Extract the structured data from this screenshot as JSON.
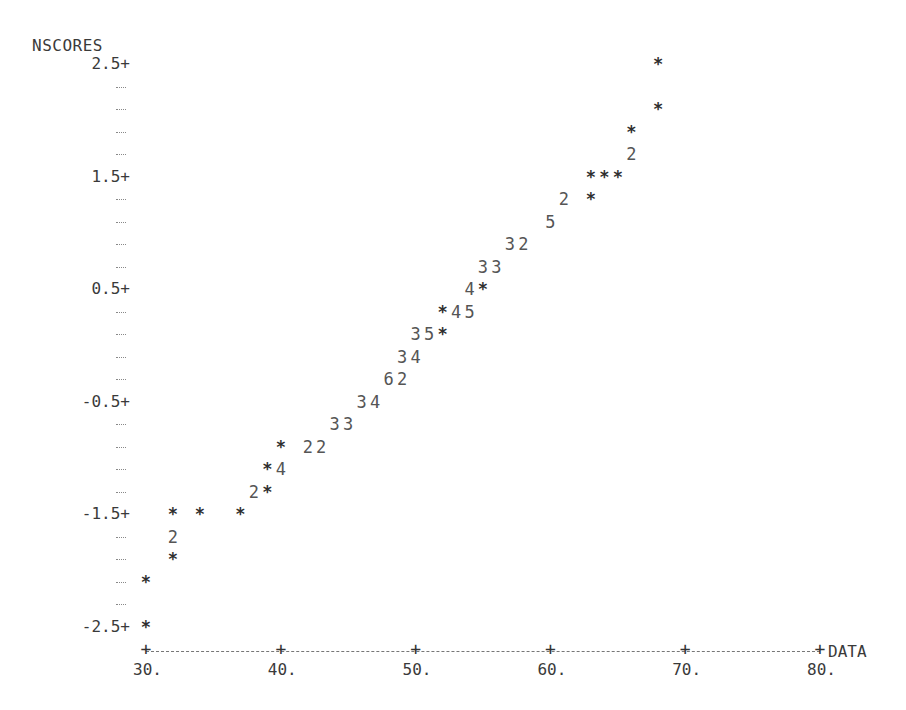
{
  "chart_data": {
    "type": "scatter",
    "title": "",
    "xlabel": "DATA",
    "ylabel": "NSCORES",
    "xlim": [
      30,
      80
    ],
    "ylim": [
      -2.5,
      2.5
    ],
    "x_ticks": [
      "30.",
      "40.",
      "50.",
      "60.",
      "70.",
      "80."
    ],
    "y_ticks": [
      "2.5",
      "1.5",
      "0.5",
      "-0.5",
      "-1.5",
      "-2.5"
    ],
    "grid": false,
    "legend": null,
    "note": "Character line-printer normal probability plot; digits indicate number of overlapping observations at that cell, '*' indicates one.",
    "rows": [
      {
        "y": 2.5,
        "cells": [
          {
            "x": 68,
            "mark": "*"
          }
        ]
      },
      {
        "y": 2.3,
        "cells": []
      },
      {
        "y": 2.1,
        "cells": [
          {
            "x": 68,
            "mark": "*"
          }
        ]
      },
      {
        "y": 1.9,
        "cells": [
          {
            "x": 66,
            "mark": "*"
          }
        ]
      },
      {
        "y": 1.7,
        "cells": [
          {
            "x": 66,
            "mark": "2"
          }
        ]
      },
      {
        "y": 1.5,
        "cells": [
          {
            "x": 63,
            "mark": "*"
          },
          {
            "x": 64,
            "mark": "*"
          },
          {
            "x": 65,
            "mark": "*"
          }
        ]
      },
      {
        "y": 1.3,
        "cells": [
          {
            "x": 61,
            "mark": "2"
          },
          {
            "x": 63,
            "mark": "*"
          }
        ]
      },
      {
        "y": 1.1,
        "cells": [
          {
            "x": 60,
            "mark": "5"
          }
        ]
      },
      {
        "y": 0.9,
        "cells": [
          {
            "x": 57,
            "mark": "3"
          },
          {
            "x": 58,
            "mark": "2"
          }
        ]
      },
      {
        "y": 0.7,
        "cells": [
          {
            "x": 55,
            "mark": "3"
          },
          {
            "x": 56,
            "mark": "3"
          }
        ]
      },
      {
        "y": 0.5,
        "cells": [
          {
            "x": 54,
            "mark": "4"
          },
          {
            "x": 55,
            "mark": "*"
          }
        ]
      },
      {
        "y": 0.3,
        "cells": [
          {
            "x": 52,
            "mark": "*"
          },
          {
            "x": 53,
            "mark": "4"
          },
          {
            "x": 54,
            "mark": "5"
          }
        ]
      },
      {
        "y": 0.1,
        "cells": [
          {
            "x": 50,
            "mark": "3"
          },
          {
            "x": 51,
            "mark": "5"
          },
          {
            "x": 52,
            "mark": "*"
          }
        ]
      },
      {
        "y": -0.1,
        "cells": [
          {
            "x": 49,
            "mark": "3"
          },
          {
            "x": 50,
            "mark": "4"
          }
        ]
      },
      {
        "y": -0.3,
        "cells": [
          {
            "x": 48,
            "mark": "6"
          },
          {
            "x": 49,
            "mark": "2"
          }
        ]
      },
      {
        "y": -0.5,
        "cells": [
          {
            "x": 46,
            "mark": "3"
          },
          {
            "x": 47,
            "mark": "4"
          }
        ]
      },
      {
        "y": -0.7,
        "cells": [
          {
            "x": 44,
            "mark": "3"
          },
          {
            "x": 45,
            "mark": "3"
          }
        ]
      },
      {
        "y": -0.9,
        "cells": [
          {
            "x": 40,
            "mark": "*"
          },
          {
            "x": 42,
            "mark": "2"
          },
          {
            "x": 43,
            "mark": "2"
          }
        ]
      },
      {
        "y": -1.1,
        "cells": [
          {
            "x": 39,
            "mark": "*"
          },
          {
            "x": 40,
            "mark": "4"
          }
        ]
      },
      {
        "y": -1.3,
        "cells": [
          {
            "x": 38,
            "mark": "2"
          },
          {
            "x": 39,
            "mark": "*"
          }
        ]
      },
      {
        "y": -1.5,
        "cells": [
          {
            "x": 32,
            "mark": "*"
          },
          {
            "x": 34,
            "mark": "*"
          },
          {
            "x": 37,
            "mark": "*"
          }
        ]
      },
      {
        "y": -1.7,
        "cells": [
          {
            "x": 32,
            "mark": "2"
          }
        ]
      },
      {
        "y": -1.9,
        "cells": [
          {
            "x": 32,
            "mark": "*"
          }
        ]
      },
      {
        "y": -2.1,
        "cells": [
          {
            "x": 30,
            "mark": "*"
          }
        ]
      },
      {
        "y": -2.3,
        "cells": []
      },
      {
        "y": -2.5,
        "cells": [
          {
            "x": 30,
            "mark": "*"
          }
        ]
      }
    ]
  },
  "labels": {
    "ylabel": "NSCORES",
    "xlabel": "DATA",
    "y_major": [
      {
        "text": "2.5+",
        "row": 0
      },
      {
        "text": "1.5+",
        "row": 5
      },
      {
        "text": "0.5+",
        "row": 10
      },
      {
        "text": "-0.5+",
        "row": 15
      },
      {
        "text": "-1.5+",
        "row": 20
      },
      {
        "text": "-2.5+",
        "row": 25
      }
    ],
    "x_major": [
      {
        "text": "30.",
        "value": 30
      },
      {
        "text": "40.",
        "value": 40
      },
      {
        "text": "50.",
        "value": 50
      },
      {
        "text": "60.",
        "value": 60
      },
      {
        "text": "70.",
        "value": 70
      },
      {
        "text": "80.",
        "value": 80
      }
    ]
  }
}
